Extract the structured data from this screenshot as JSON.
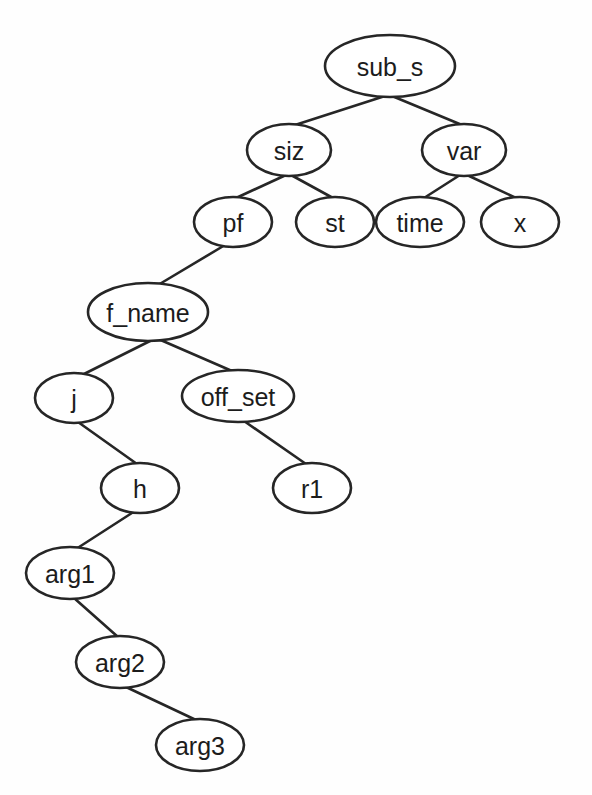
{
  "diagram": {
    "type": "tree",
    "title": "",
    "style": {
      "node_shape": "ellipse",
      "node_fill": "#ffffff",
      "stroke_color": "#262626",
      "stroke_width": 2.6,
      "label_color": "#1c1c1c",
      "background": "#fefefe",
      "font_size": 25
    },
    "nodes": [
      {
        "id": "sub_s",
        "label": "sub_s",
        "cx": 390,
        "cy": 66,
        "rx": 65,
        "ry": 31
      },
      {
        "id": "siz",
        "label": "siz",
        "cx": 289,
        "cy": 150,
        "rx": 42,
        "ry": 26
      },
      {
        "id": "var",
        "label": "var",
        "cx": 464,
        "cy": 150,
        "rx": 42,
        "ry": 26
      },
      {
        "id": "pf",
        "label": "pf",
        "cx": 233,
        "cy": 222,
        "rx": 39,
        "ry": 25
      },
      {
        "id": "st",
        "label": "st",
        "cx": 335,
        "cy": 222,
        "rx": 39,
        "ry": 25
      },
      {
        "id": "time",
        "label": "time",
        "cx": 420,
        "cy": 222,
        "rx": 44,
        "ry": 25
      },
      {
        "id": "x",
        "label": "x",
        "cx": 520,
        "cy": 222,
        "rx": 39,
        "ry": 25
      },
      {
        "id": "f_name",
        "label": "f_name",
        "cx": 148,
        "cy": 312,
        "rx": 60,
        "ry": 29
      },
      {
        "id": "j",
        "label": "j",
        "cx": 74,
        "cy": 398,
        "rx": 39,
        "ry": 25
      },
      {
        "id": "off_set",
        "label": "off_set",
        "cx": 238,
        "cy": 396,
        "rx": 56,
        "ry": 26
      },
      {
        "id": "h",
        "label": "h",
        "cx": 140,
        "cy": 488,
        "rx": 39,
        "ry": 25
      },
      {
        "id": "r1",
        "label": "r1",
        "cx": 312,
        "cy": 488,
        "rx": 39,
        "ry": 25
      },
      {
        "id": "arg1",
        "label": "arg1",
        "cx": 70,
        "cy": 573,
        "rx": 44,
        "ry": 26
      },
      {
        "id": "arg2",
        "label": "arg2",
        "cx": 120,
        "cy": 662,
        "rx": 44,
        "ry": 26
      },
      {
        "id": "arg3",
        "label": "arg3",
        "cx": 200,
        "cy": 745,
        "rx": 44,
        "ry": 26
      }
    ],
    "edges": [
      {
        "from": "sub_s",
        "to": "siz",
        "x1": 385,
        "y1": 96,
        "x2": 295,
        "y2": 125
      },
      {
        "from": "sub_s",
        "to": "var",
        "x1": 392,
        "y1": 96,
        "x2": 462,
        "y2": 125
      },
      {
        "from": "siz",
        "to": "pf",
        "x1": 286,
        "y1": 175,
        "x2": 236,
        "y2": 198
      },
      {
        "from": "siz",
        "to": "st",
        "x1": 291,
        "y1": 175,
        "x2": 333,
        "y2": 198
      },
      {
        "from": "var",
        "to": "time",
        "x1": 460,
        "y1": 175,
        "x2": 424,
        "y2": 198
      },
      {
        "from": "var",
        "to": "x",
        "x1": 467,
        "y1": 175,
        "x2": 516,
        "y2": 198
      },
      {
        "from": "pf",
        "to": "f_name",
        "x1": 225,
        "y1": 245,
        "x2": 158,
        "y2": 285
      },
      {
        "from": "f_name",
        "to": "j",
        "x1": 152,
        "y1": 340,
        "x2": 82,
        "y2": 375
      },
      {
        "from": "f_name",
        "to": "off_set",
        "x1": 156,
        "y1": 338,
        "x2": 232,
        "y2": 371
      },
      {
        "from": "j",
        "to": "h",
        "x1": 78,
        "y1": 422,
        "x2": 137,
        "y2": 464
      },
      {
        "from": "off_set",
        "to": "r1",
        "x1": 244,
        "y1": 421,
        "x2": 306,
        "y2": 464
      },
      {
        "from": "h",
        "to": "arg1",
        "x1": 135,
        "y1": 511,
        "x2": 76,
        "y2": 549
      },
      {
        "from": "arg1",
        "to": "arg2",
        "x1": 74,
        "y1": 598,
        "x2": 118,
        "y2": 637
      },
      {
        "from": "arg2",
        "to": "arg3",
        "x1": 126,
        "y1": 687,
        "x2": 196,
        "y2": 720
      }
    ]
  }
}
